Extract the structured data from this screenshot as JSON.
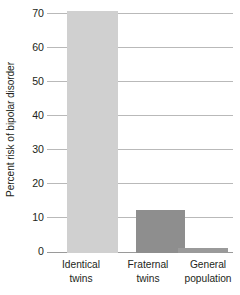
{
  "chart_data": {
    "type": "bar",
    "title": "",
    "subtitle": "",
    "xlabel": "",
    "ylabel": "Percent risk of bipolar disorder",
    "categories": [
      "Identical twins",
      "Fraternal twins",
      "General population"
    ],
    "values": [
      71,
      12.5,
      1.5
    ],
    "series": [
      {
        "name": "Percent risk of bipolar disorder",
        "values": [
          71,
          12.5,
          1.5
        ]
      }
    ],
    "ylim": [
      0,
      70
    ],
    "yticks": [
      0,
      10,
      20,
      30,
      40,
      50,
      60,
      70
    ],
    "ytick_labels": [
      "0",
      "10",
      "20",
      "30",
      "40",
      "50",
      "60",
      "70"
    ],
    "grid": true,
    "legend": "none",
    "bar_colors": [
      "#d0d0d0",
      "#8e8e8e",
      "#9a9a9a"
    ],
    "gridline_color": "#b9b9b9",
    "axis_color": "#9a9a9a",
    "background": "#ffffff",
    "text_color": "#231f20"
  },
  "axis": {
    "y_title": "Percent risk of bipolar disorder",
    "ticks": [
      {
        "label": "70",
        "value": 70
      },
      {
        "label": "60",
        "value": 60
      },
      {
        "label": "50",
        "value": 50
      },
      {
        "label": "40",
        "value": 40
      },
      {
        "label": "30",
        "value": 30
      },
      {
        "label": "20",
        "value": 20
      },
      {
        "label": "10",
        "value": 10
      },
      {
        "label": "0",
        "value": 0
      }
    ]
  },
  "bars": [
    {
      "line1": "Identical",
      "line2": "twins",
      "value": 71,
      "color": "#d0d0d0"
    },
    {
      "line1": "Fraternal",
      "line2": "twins",
      "value": 12.5,
      "color": "#8e8e8e"
    },
    {
      "line1": "General",
      "line2": "population",
      "value": 1.5,
      "color": "#9a9a9a"
    }
  ]
}
